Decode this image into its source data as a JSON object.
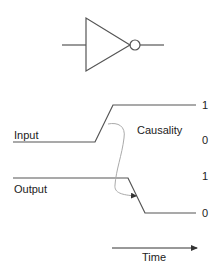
{
  "diagram": {
    "gate": {
      "type": "inverter",
      "name": "NOT gate"
    },
    "signals": {
      "input": {
        "label": "Input",
        "high_label": "1",
        "low_label": "0",
        "initial": "0",
        "final": "1"
      },
      "output": {
        "label": "Output",
        "high_label": "1",
        "low_label": "0",
        "initial": "1",
        "final": "0"
      }
    },
    "causality_label": "Causality",
    "time_label": "Time",
    "colors": {
      "stroke": "#555555",
      "causality_curve": "#aaaaaa",
      "text": "#222222"
    }
  }
}
